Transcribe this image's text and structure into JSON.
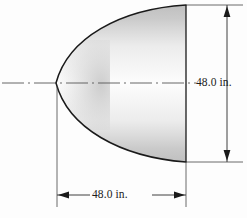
{
  "figure": {
    "shape_name": "parabolic-segment",
    "background_color": "#fdfdfd",
    "outline_color": "#1a1a1a",
    "shade_color": "#c9c9c9",
    "centerline_color": "#555555",
    "dimension_line_color": "#2b2b2b"
  },
  "dimensions": {
    "vertical": {
      "label": "48.0 in.",
      "value": 48.0,
      "unit": "in.",
      "orientation": "vertical",
      "arrow_top": "up",
      "arrow_bottom": "down"
    },
    "horizontal": {
      "label": "48.0 in.",
      "value": 48.0,
      "unit": "in.",
      "orientation": "horizontal",
      "arrow_left": "left",
      "arrow_right": "right"
    }
  },
  "geometry": {
    "vertex_x": 56,
    "vertex_y": 83,
    "base_x": 186,
    "base_top_y": 5,
    "base_bottom_y": 162,
    "centerline_y": 83,
    "centerline_start_x": 2,
    "centerline_end_x": 196,
    "vertical_dim_x": 227,
    "horizontal_dim_y": 195
  }
}
